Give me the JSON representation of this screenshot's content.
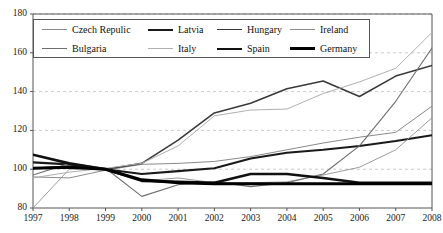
{
  "chart_data": {
    "type": "line",
    "title": "",
    "xlabel": "",
    "ylabel": "",
    "x": [
      1997,
      1998,
      1999,
      2000,
      2001,
      2002,
      2003,
      2004,
      2005,
      2006,
      2007,
      2008
    ],
    "xtick_labels": [
      "1997",
      "1998",
      "1999",
      "2000",
      "2001",
      "2002",
      "2003",
      "2004",
      "2005",
      "2006",
      "2007",
      "2008"
    ],
    "ytick_labels": [
      "80",
      "100",
      "120",
      "140",
      "160",
      "180"
    ],
    "yticks": [
      80,
      100,
      120,
      140,
      160,
      180
    ],
    "ylim": [
      80,
      180
    ],
    "xlim": [
      1997,
      2008
    ],
    "grid": "horizontal-dashed",
    "legend_position": "top-left-inside",
    "series": [
      {
        "name": "Czech Repulic",
        "color": "#8a8a8a",
        "width": 1.0,
        "values": [
          96.0,
          95.5,
          99.5,
          102.5,
          103.0,
          104.0,
          106.5,
          110.0,
          113.5,
          116.5,
          119.0,
          132.5
        ]
      },
      {
        "name": "Latvia",
        "color": "#1a1a1a",
        "width": 2.1,
        "values": [
          103.5,
          102.5,
          100.0,
          97.5,
          99.0,
          100.5,
          105.5,
          108.5,
          110.0,
          112.0,
          114.5,
          117.5
        ]
      },
      {
        "name": "Hungary",
        "color": "#3a3a3a",
        "width": 1.6,
        "values": [
          100.5,
          101.5,
          100.0,
          103.0,
          115.0,
          129.0,
          134.0,
          141.5,
          145.5,
          137.5,
          148.0,
          153.5
        ]
      },
      {
        "name": "Ireland",
        "color": "#909090",
        "width": 0.9,
        "values": [
          80.0,
          100.0,
          100.0,
          94.0,
          95.5,
          93.0,
          93.0,
          93.5,
          97.0,
          101.0,
          110.0,
          126.5
        ]
      },
      {
        "name": "Bulgaria",
        "color": "#6e6e6e",
        "width": 1.1,
        "values": [
          97.0,
          103.0,
          100.5,
          86.0,
          92.0,
          93.5,
          91.0,
          93.0,
          97.5,
          112.0,
          135.0,
          162.5
        ]
      },
      {
        "name": "Italy",
        "color": "#b0b0b0",
        "width": 1.0,
        "values": [
          95.5,
          98.5,
          100.5,
          103.0,
          112.0,
          127.5,
          130.5,
          131.0,
          139.0,
          145.0,
          152.0,
          170.5
        ]
      },
      {
        "name": "Spain",
        "color": "#111111",
        "width": 2.6,
        "values": [
          107.5,
          103.0,
          100.0,
          94.0,
          93.5,
          93.0,
          97.5,
          97.5,
          95.5,
          93.0,
          93.0,
          93.0
        ]
      },
      {
        "name": "Germany",
        "color": "#000000",
        "width": 3.0,
        "values": [
          100.5,
          101.0,
          100.0,
          94.5,
          93.0,
          92.5,
          92.5,
          92.5,
          92.5,
          92.5,
          92.5,
          92.5
        ]
      }
    ]
  },
  "legend": {
    "rows": [
      [
        {
          "label": "Czech Repulic",
          "color": "#8a8a8a",
          "width": 1.0
        },
        {
          "label": "Latvia",
          "color": "#1a1a1a",
          "width": 2.2
        },
        {
          "label": "Hungary",
          "color": "#3a3a3a",
          "width": 1.7
        },
        {
          "label": "Ireland",
          "color": "#909090",
          "width": 1.0
        }
      ],
      [
        {
          "label": "Bulgaria",
          "color": "#6e6e6e",
          "width": 1.2
        },
        {
          "label": "Italy",
          "color": "#b0b0b0",
          "width": 1.0
        },
        {
          "label": "Spain",
          "color": "#111111",
          "width": 2.6
        },
        {
          "label": "Germany",
          "color": "#000000",
          "width": 3.2
        }
      ]
    ]
  },
  "axes": {
    "axis_color": "#555555",
    "grid_color": "#bdbdbd",
    "tick_color": "#555555"
  }
}
